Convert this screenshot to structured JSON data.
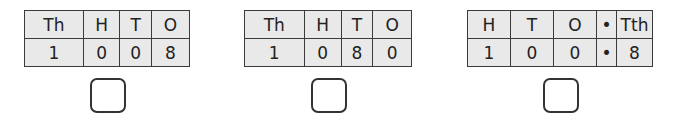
{
  "questions": [
    {
      "headers": [
        "Th",
        "H",
        "T",
        "O"
      ],
      "digits": [
        "1",
        "0",
        "0",
        "8"
      ]
    },
    {
      "headers": [
        "Th",
        "H",
        "T",
        "O"
      ],
      "digits": [
        "1",
        "0",
        "8",
        "0"
      ]
    },
    {
      "headers": [
        "H",
        "T",
        "O",
        "•",
        "Tth"
      ],
      "digits": [
        "1",
        "0",
        "0",
        "•",
        "8"
      ]
    }
  ],
  "answer_boxes": [
    "",
    "",
    ""
  ],
  "colors": {
    "cell_bg": "#e9e9e9",
    "border": "#3a3a3a",
    "text": "#222222"
  }
}
